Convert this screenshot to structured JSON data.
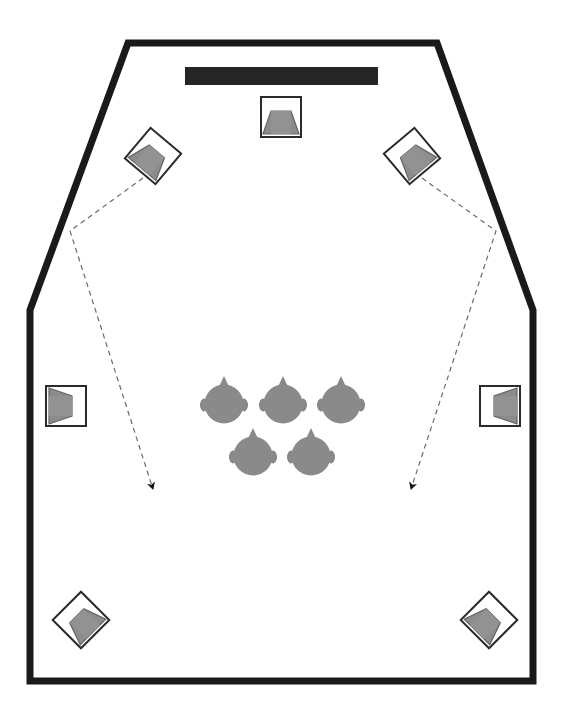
{
  "diagram": {
    "type": "floor-plan",
    "canvas": {
      "width": 565,
      "height": 721
    },
    "background_color": "#ffffff"
  },
  "colors": {
    "wall": "#1a1a1a",
    "screen": "#262626",
    "speaker_outline": "#2b2b2b",
    "speaker_fill": "#8c8c8c",
    "speaker_body": "#ffffff",
    "head_fill": "#8a8a8a",
    "head_outline": "#8a8a8a",
    "guide_line": "#6b6b6b",
    "arrow": "#111111"
  },
  "room": {
    "name": "room-outline",
    "shape": "pentagon-top-chamfer",
    "stroke_width": 7,
    "points": "128,43 437,43 533,310 533,681 30,681 30,310",
    "vertices": [
      {
        "name": "top-left-chamfer",
        "x": 128,
        "y": 43
      },
      {
        "name": "top-right-chamfer",
        "x": 437,
        "y": 43
      },
      {
        "name": "right-bend",
        "x": 533,
        "y": 310
      },
      {
        "name": "bottom-right",
        "x": 533,
        "y": 681
      },
      {
        "name": "bottom-left",
        "x": 30,
        "y": 681
      },
      {
        "name": "left-bend",
        "x": 30,
        "y": 310
      }
    ]
  },
  "screen": {
    "name": "projection-screen",
    "label": "screen",
    "x": 185,
    "y": 67,
    "width": 193,
    "height": 18
  },
  "speakers": [
    {
      "id": "speaker-front-center",
      "label": "Front Center Speaker",
      "position": "front-center",
      "cx": 281,
      "cy": 117,
      "size": 40,
      "rotation": 0
    },
    {
      "id": "speaker-front-left",
      "label": "Front Left Speaker",
      "position": "front-left",
      "cx": 153,
      "cy": 156,
      "size": 40,
      "rotation": 40
    },
    {
      "id": "speaker-front-right",
      "label": "Front Right Speaker",
      "position": "front-right",
      "cx": 412,
      "cy": 156,
      "size": 40,
      "rotation": -40
    },
    {
      "id": "speaker-surround-left",
      "label": "Surround Left Speaker",
      "position": "side-left",
      "cx": 66,
      "cy": 406,
      "size": 40,
      "rotation": 90
    },
    {
      "id": "speaker-surround-right",
      "label": "Surround Right Speaker",
      "position": "side-right",
      "cx": 500,
      "cy": 406,
      "size": 40,
      "rotation": -90
    },
    {
      "id": "speaker-rear-left",
      "label": "Rear Left Speaker",
      "position": "rear-left",
      "cx": 81,
      "cy": 620,
      "size": 40,
      "rotation": -45
    },
    {
      "id": "speaker-rear-right",
      "label": "Rear Right Speaker",
      "position": "rear-right",
      "cx": 489,
      "cy": 620,
      "size": 40,
      "rotation": 45
    }
  ],
  "listeners": [
    {
      "id": "listener-1",
      "label": "Listener 1",
      "row": "front",
      "cx": 224,
      "cy": 404,
      "r": 20
    },
    {
      "id": "listener-2",
      "label": "Listener 2",
      "row": "front",
      "cx": 283,
      "cy": 404,
      "r": 20
    },
    {
      "id": "listener-3",
      "label": "Listener 3",
      "row": "front",
      "cx": 341,
      "cy": 404,
      "r": 20
    },
    {
      "id": "listener-4",
      "label": "Listener 4",
      "row": "back",
      "cx": 253,
      "cy": 456,
      "r": 20
    },
    {
      "id": "listener-5",
      "label": "Listener 5",
      "row": "back",
      "cx": 311,
      "cy": 456,
      "r": 20
    }
  ],
  "guides": [
    {
      "id": "guide-left",
      "label": "Left projection / coverage guide",
      "path": "M 143,178 L 70,231 L 152,486",
      "arrow_at": {
        "x": 152,
        "y": 486
      },
      "arrow_angle": 72,
      "dash": "5,4"
    },
    {
      "id": "guide-right",
      "label": "Right projection / coverage guide",
      "path": "M 422,178 L 496,231 L 412,486",
      "arrow_at": {
        "x": 412,
        "y": 486
      },
      "arrow_angle": 108,
      "dash": "5,4"
    }
  ],
  "legend": {
    "speaker_icon_name": "loudspeaker-icon",
    "listener_icon_name": "head-top-view-icon",
    "screen_icon_name": "screen-bar-icon"
  }
}
